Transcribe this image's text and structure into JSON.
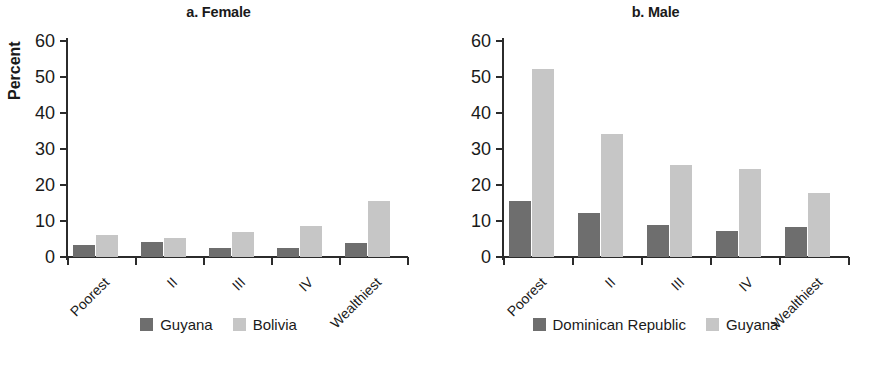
{
  "figure": {
    "ylabel": "Percent",
    "categories": [
      "Poorest",
      "II",
      "III",
      "IV",
      "Wealthiest"
    ],
    "yticks": [
      0,
      10,
      20,
      30,
      40,
      50,
      60
    ],
    "ylim": [
      0,
      60
    ],
    "colors": {
      "dark": "#6e6e6e",
      "light": "#c6c6c6",
      "axis": "#2b2b2b",
      "background": "#ffffff"
    }
  },
  "panels": [
    {
      "id": "female",
      "title": "a. Female",
      "legend": [
        {
          "label": "Guyana",
          "swatch": "dark"
        },
        {
          "label": "Bolivia",
          "swatch": "light"
        }
      ]
    },
    {
      "id": "male",
      "title": "b. Male",
      "legend": [
        {
          "label": "Dominican Republic",
          "swatch": "dark"
        },
        {
          "label": "Guyana",
          "swatch": "light"
        }
      ]
    }
  ],
  "chart_data": [
    {
      "type": "bar",
      "title": "a. Female",
      "xlabel": "",
      "ylabel": "Percent",
      "ylim": [
        0,
        60
      ],
      "yticks": [
        0,
        10,
        20,
        30,
        40,
        50,
        60
      ],
      "grid": false,
      "legend_position": "bottom",
      "categories": [
        "Poorest",
        "II",
        "III",
        "IV",
        "Wealthiest"
      ],
      "series": [
        {
          "name": "Guyana",
          "color": "#6e6e6e",
          "values": [
            3.2,
            4.2,
            2.4,
            2.5,
            4.0
          ]
        },
        {
          "name": "Bolivia",
          "color": "#c6c6c6",
          "values": [
            6.1,
            5.2,
            6.9,
            8.5,
            15.5
          ]
        }
      ]
    },
    {
      "type": "bar",
      "title": "b. Male",
      "xlabel": "",
      "ylabel": "Percent",
      "ylim": [
        0,
        60
      ],
      "yticks": [
        0,
        10,
        20,
        30,
        40,
        50,
        60
      ],
      "grid": false,
      "legend_position": "bottom",
      "categories": [
        "Poorest",
        "II",
        "III",
        "IV",
        "Wealthiest"
      ],
      "series": [
        {
          "name": "Dominican Republic",
          "color": "#6e6e6e",
          "values": [
            15.5,
            12.3,
            9.0,
            7.3,
            8.2
          ]
        },
        {
          "name": "Guyana",
          "color": "#c6c6c6",
          "values": [
            52.3,
            34.3,
            25.5,
            24.5,
            17.8
          ]
        }
      ]
    }
  ]
}
